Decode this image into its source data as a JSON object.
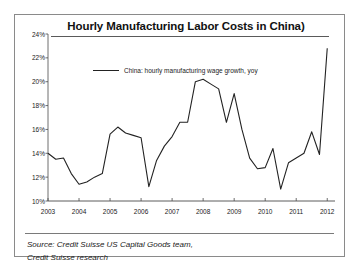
{
  "figure": {
    "title": "Hourly Manufacturing Labor Costs in China)",
    "source_line_1": "Source: Credit Suisse US Capital Goods team,",
    "source_line_2": "Credit Suisse research"
  },
  "chart_data": {
    "type": "line",
    "title": "Hourly Manufacturing Labor Costs in China)",
    "xlabel": "",
    "ylabel": "",
    "ylim": [
      10,
      24
    ],
    "xlim": [
      2003.0,
      2012.25
    ],
    "ytick_labels": [
      "24%",
      "22%",
      "20%",
      "18%",
      "16%",
      "14%",
      "12%",
      "10%"
    ],
    "ytick_values": [
      24,
      22,
      20,
      18,
      16,
      14,
      12,
      10
    ],
    "xtick_labels": [
      "2003",
      "2004",
      "2005",
      "2006",
      "2007",
      "2008",
      "2009",
      "2010",
      "2011",
      "2012"
    ],
    "xtick_values": [
      2003,
      2004,
      2005,
      2006,
      2007,
      2008,
      2009,
      2010,
      2011,
      2012
    ],
    "grid": false,
    "legend_position": "upper-center",
    "legend": [
      "China: hourly manufacturing wage growth, yoy"
    ],
    "series": [
      {
        "name": "China: hourly manufacturing wage growth, yoy",
        "color": "#222222",
        "x": [
          2003.0,
          2003.25,
          2003.5,
          2003.75,
          2004.0,
          2004.25,
          2004.5,
          2004.75,
          2005.0,
          2005.25,
          2005.5,
          2005.75,
          2006.0,
          2006.25,
          2006.5,
          2006.75,
          2007.0,
          2007.25,
          2007.5,
          2007.75,
          2008.0,
          2008.25,
          2008.5,
          2008.75,
          2009.0,
          2009.25,
          2009.5,
          2009.75,
          2010.0,
          2010.25,
          2010.5,
          2010.75,
          2011.0,
          2011.25,
          2011.5,
          2011.75,
          2012.0
        ],
        "values": [
          14.0,
          13.5,
          13.6,
          12.3,
          11.4,
          11.6,
          12.0,
          12.3,
          15.6,
          16.2,
          15.7,
          15.5,
          15.3,
          11.2,
          13.4,
          14.6,
          15.4,
          16.6,
          16.6,
          20.0,
          20.2,
          19.8,
          19.4,
          16.6,
          19.0,
          16.0,
          13.6,
          12.7,
          12.8,
          14.4,
          11.0,
          13.2,
          13.6,
          14.0,
          15.8,
          13.9,
          22.8
        ]
      }
    ]
  }
}
